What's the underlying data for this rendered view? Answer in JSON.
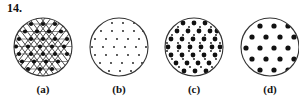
{
  "figure": {
    "number_label": "14.",
    "background_color": "#ffffff",
    "ink_color": "#111111",
    "line_color": "#4a4a4a",
    "panels": [
      {
        "id": "a",
        "label": "(a)",
        "description": "circle filled with triangular lattice lines and medium square-ish dots at every lattice vertex",
        "circle": {
          "cx": 30,
          "cy": 30,
          "r": 29
        },
        "show_lattice_lines": true,
        "dot_color": "#111111",
        "rows": [
          {
            "y": 7,
            "dot_r": 2.1,
            "xs": [
              18,
              30,
              42
            ]
          },
          {
            "y": 14.5,
            "dot_r": 2.1,
            "xs": [
              12,
              24,
              36,
              48
            ]
          },
          {
            "y": 22,
            "dot_r": 2.1,
            "xs": [
              6,
              18,
              30,
              42,
              54
            ]
          },
          {
            "y": 29.5,
            "dot_r": 2.1,
            "xs": [
              3,
              15,
              27,
              39,
              51
            ]
          },
          {
            "y": 37,
            "dot_r": 2.1,
            "xs": [
              6,
              18,
              30,
              42,
              54
            ]
          },
          {
            "y": 44.5,
            "dot_r": 2.1,
            "xs": [
              9,
              21,
              33,
              45
            ]
          },
          {
            "y": 52,
            "dot_r": 2.1,
            "xs": [
              15,
              27,
              39,
              51
            ]
          }
        ]
      },
      {
        "id": "b",
        "label": "(b)",
        "description": "circle with sparse small dots on a staggered grid, no lattice lines",
        "circle": {
          "cx": 30,
          "cy": 30,
          "r": 29
        },
        "show_lattice_lines": false,
        "dot_color": "#111111",
        "rows": [
          {
            "y": 6,
            "dot_r": 0.9,
            "xs": [
              23,
              34,
              45
            ]
          },
          {
            "y": 14,
            "dot_r": 0.9,
            "xs": [
              12,
              23,
              34,
              45,
              54
            ]
          },
          {
            "y": 22,
            "dot_r": 0.9,
            "xs": [
              6,
              17,
              28,
              39,
              50
            ]
          },
          {
            "y": 30,
            "dot_r": 0.9,
            "xs": [
              3,
              14,
              25,
              36,
              47,
              57
            ]
          },
          {
            "y": 38,
            "dot_r": 0.9,
            "xs": [
              6,
              17,
              28,
              39,
              50
            ]
          },
          {
            "y": 46,
            "dot_r": 0.9,
            "xs": [
              11,
              22,
              33,
              44,
              53
            ]
          },
          {
            "y": 54,
            "dot_r": 0.9,
            "xs": [
              20,
              31,
              42
            ]
          }
        ]
      },
      {
        "id": "c",
        "label": "(c)",
        "description": "circle densely packed with large dots on a triangular lattice plus small dots in the interstices",
        "circle": {
          "cx": 30,
          "cy": 30,
          "r": 29
        },
        "show_lattice_lines": false,
        "dot_color": "#111111",
        "rows": [
          {
            "y": 6,
            "dot_r": 2.4,
            "xs": [
              19,
              30,
              41
            ]
          },
          {
            "y": 10,
            "dot_r": 0.9,
            "xs": [
              14,
              25,
              36,
              47
            ]
          },
          {
            "y": 14,
            "dot_r": 2.4,
            "xs": [
              13,
              24,
              35,
              46,
              53
            ]
          },
          {
            "y": 18,
            "dot_r": 0.9,
            "xs": [
              8,
              19,
              30,
              41,
              52
            ]
          },
          {
            "y": 22,
            "dot_r": 2.4,
            "xs": [
              7,
              18,
              29,
              40,
              51
            ]
          },
          {
            "y": 26,
            "dot_r": 0.9,
            "xs": [
              3,
              14,
              25,
              36,
              47,
              56
            ]
          },
          {
            "y": 30,
            "dot_r": 2.4,
            "xs": [
              4,
              15,
              26,
              37,
              48,
              56
            ]
          },
          {
            "y": 34,
            "dot_r": 0.9,
            "xs": [
              3,
              14,
              25,
              36,
              47,
              56
            ]
          },
          {
            "y": 38,
            "dot_r": 2.4,
            "xs": [
              7,
              18,
              29,
              40,
              51
            ]
          },
          {
            "y": 42,
            "dot_r": 0.9,
            "xs": [
              8,
              19,
              30,
              41,
              52
            ]
          },
          {
            "y": 46,
            "dot_r": 2.4,
            "xs": [
              12,
              23,
              34,
              45
            ]
          },
          {
            "y": 50,
            "dot_r": 0.9,
            "xs": [
              15,
              26,
              37,
              48
            ]
          },
          {
            "y": 54,
            "dot_r": 2.4,
            "xs": [
              20,
              31,
              42
            ]
          }
        ]
      },
      {
        "id": "d",
        "label": "(d)",
        "description": "circle with widely spaced large dots on a staggered grid; circle is clipped by the right edge of the image",
        "circle": {
          "cx": 30,
          "cy": 30,
          "r": 29
        },
        "show_lattice_lines": false,
        "dot_color": "#111111",
        "rows": [
          {
            "y": 9,
            "dot_r": 2.6,
            "xs": [
              20,
              34,
              48
            ]
          },
          {
            "y": 20,
            "dot_r": 2.6,
            "xs": [
              12,
              26,
              40,
              54
            ]
          },
          {
            "y": 31,
            "dot_r": 2.6,
            "xs": [
              6,
              20,
              34,
              48
            ]
          },
          {
            "y": 42,
            "dot_r": 2.6,
            "xs": [
              12,
              26,
              40,
              54
            ]
          },
          {
            "y": 53,
            "dot_r": 2.6,
            "xs": [
              20,
              34,
              48
            ]
          }
        ]
      }
    ]
  }
}
